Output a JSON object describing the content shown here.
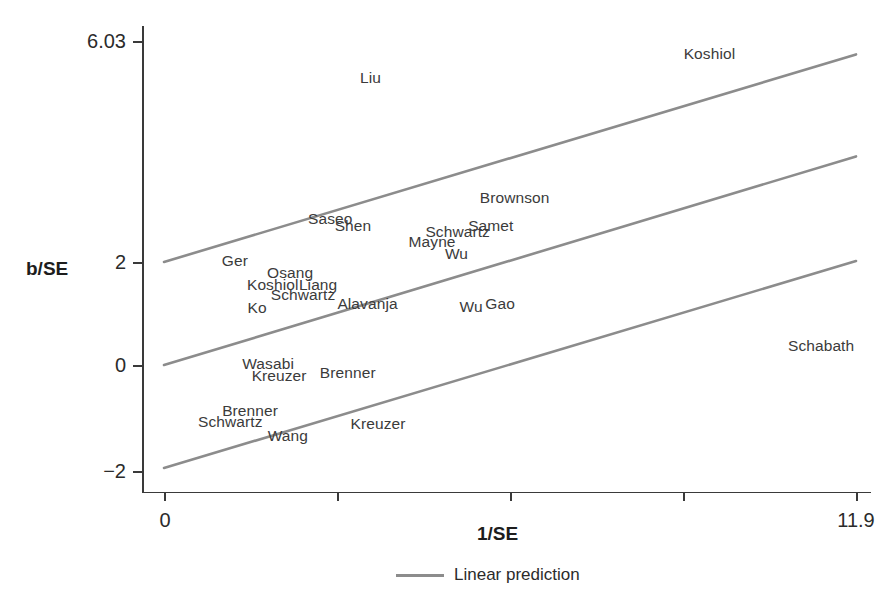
{
  "chart_data": {
    "type": "scatter",
    "title": "",
    "subtitle": "",
    "xlabel": "1/SE",
    "ylabel": "b/SE",
    "xlim": [
      0,
      11.9
    ],
    "ylim": [
      -2,
      6.03
    ],
    "grid": false,
    "legend_position": "bottom-center",
    "x_tick_labels": [
      "0",
      "11.9"
    ],
    "x_tick_values": [
      0,
      11.9
    ],
    "x_minor_tick_values": [
      2.975,
      5.95,
      8.925
    ],
    "y_tick_labels": [
      "6.03",
      "2",
      "0",
      "-2"
    ],
    "y_tick_values": [
      6.03,
      2,
      0,
      -2
    ],
    "legend": [
      {
        "name": "Linear prediction",
        "type": "line",
        "color": "#8c8c8c"
      }
    ],
    "series": [
      {
        "name": "Linear prediction (upper)",
        "type": "line",
        "color": "#8c8c8c",
        "x": [
          0,
          11.9
        ],
        "y": [
          2.0,
          6.03
        ]
      },
      {
        "name": "Linear prediction (center)",
        "type": "line",
        "color": "#8c8c8c",
        "x": [
          0,
          11.9
        ],
        "y": [
          0.0,
          4.05
        ]
      },
      {
        "name": "Linear prediction (lower)",
        "type": "line",
        "color": "#8c8c8c",
        "x": [
          0,
          11.9
        ],
        "y": [
          -2.0,
          2.02
        ]
      }
    ],
    "points": [
      {
        "label": "Liu",
        "x": 3.55,
        "y": 5.58
      },
      {
        "label": "Koshiol",
        "x": 9.38,
        "y": 6.03
      },
      {
        "label": "Brownson",
        "x": 6.03,
        "y": 3.25
      },
      {
        "label": "Saseo",
        "x": 2.86,
        "y": 2.84
      },
      {
        "label": "Shen",
        "x": 3.25,
        "y": 2.7
      },
      {
        "label": "Samet",
        "x": 5.62,
        "y": 2.7
      },
      {
        "label": "Schwartz",
        "x": 5.05,
        "y": 2.58
      },
      {
        "label": "Mayne",
        "x": 4.61,
        "y": 2.38
      },
      {
        "label": "Wu",
        "x": 5.03,
        "y": 2.16
      },
      {
        "label": "Ger",
        "x": 1.22,
        "y": 2.02
      },
      {
        "label": "Osang",
        "x": 2.17,
        "y": 1.78
      },
      {
        "label": "Koshiol",
        "x": 1.87,
        "y": 1.56
      },
      {
        "label": "Liang",
        "x": 2.65,
        "y": 1.56
      },
      {
        "label": "Schwartz",
        "x": 2.39,
        "y": 1.36
      },
      {
        "label": "Alavanja",
        "x": 3.5,
        "y": 1.18
      },
      {
        "label": "Ko",
        "x": 1.6,
        "y": 1.1
      },
      {
        "label": "Wu",
        "x": 5.28,
        "y": 1.12
      },
      {
        "label": "Gao",
        "x": 5.78,
        "y": 1.18
      },
      {
        "label": "Schabath",
        "x": 11.3,
        "y": 0.36
      },
      {
        "label": "Wasabi",
        "x": 1.79,
        "y": 0.02
      },
      {
        "label": "Kreuzer",
        "x": 1.98,
        "y": -0.22
      },
      {
        "label": "Brenner",
        "x": 3.16,
        "y": -0.16
      },
      {
        "label": "Brenner",
        "x": 1.48,
        "y": -0.9
      },
      {
        "label": "Schwartz",
        "x": 1.14,
        "y": -1.1
      },
      {
        "label": "Kreuzer",
        "x": 3.68,
        "y": -1.14
      },
      {
        "label": "Wang",
        "x": 2.13,
        "y": -1.38
      }
    ]
  },
  "axes": {
    "y_title": "b/SE",
    "x_title": "1/SE",
    "y_ticks": [
      {
        "label": "6.03",
        "value": 6.03
      },
      {
        "label": "2",
        "value": 2
      },
      {
        "label": "0",
        "value": 0
      },
      {
        "label": "−2",
        "value": -2
      }
    ],
    "x_ticks": [
      {
        "label": "0",
        "value": 0
      },
      {
        "label": "11.9",
        "value": 11.9
      }
    ]
  },
  "legend": {
    "linear_prediction_label": "Linear prediction",
    "line_color": "#8c8c8c"
  }
}
